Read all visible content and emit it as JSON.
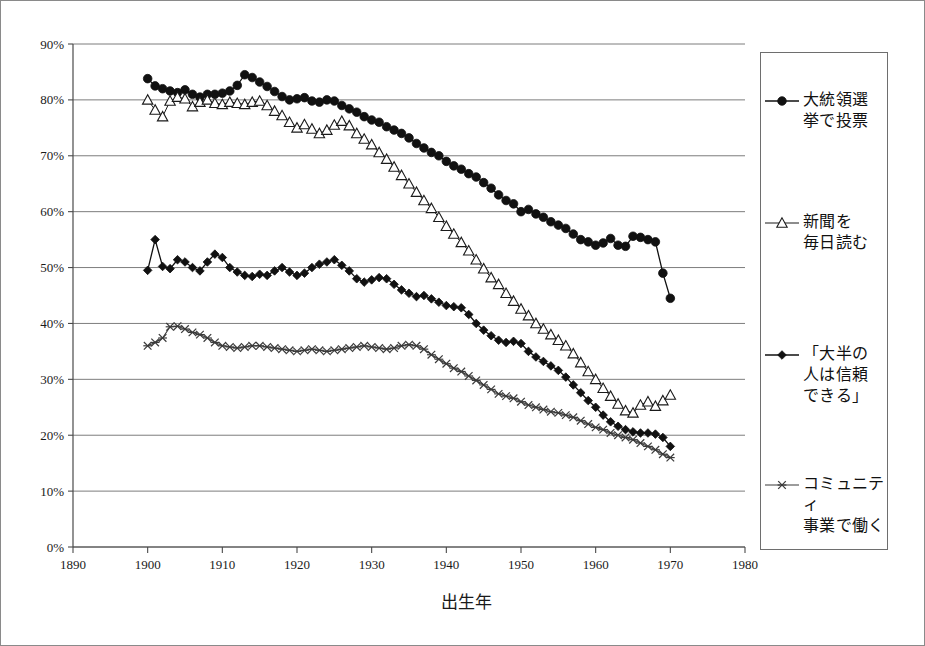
{
  "chart_data": {
    "type": "line",
    "title": "",
    "xlabel": "出生年",
    "ylabel": "",
    "xlim": [
      1890,
      1980
    ],
    "ylim": [
      0,
      90
    ],
    "x_ticks": [
      "1890",
      "1900",
      "1910",
      "1920",
      "1930",
      "1940",
      "1950",
      "1960",
      "1970",
      "1980"
    ],
    "y_ticks": [
      "0%",
      "10%",
      "20%",
      "30%",
      "40%",
      "50%",
      "60%",
      "70%",
      "80%",
      "90%"
    ],
    "grid": true,
    "legend_position": "right",
    "x": [
      1900,
      1901,
      1902,
      1903,
      1904,
      1905,
      1906,
      1907,
      1908,
      1909,
      1910,
      1911,
      1912,
      1913,
      1914,
      1915,
      1916,
      1917,
      1918,
      1919,
      1920,
      1921,
      1922,
      1923,
      1924,
      1925,
      1926,
      1927,
      1928,
      1929,
      1930,
      1931,
      1932,
      1933,
      1934,
      1935,
      1936,
      1937,
      1938,
      1939,
      1940,
      1941,
      1942,
      1943,
      1944,
      1945,
      1946,
      1947,
      1948,
      1949,
      1950,
      1951,
      1952,
      1953,
      1954,
      1955,
      1956,
      1957,
      1958,
      1959,
      1960,
      1961,
      1962,
      1963,
      1964,
      1965,
      1966,
      1967,
      1968,
      1969,
      1970
    ],
    "series": [
      {
        "name": "大統領選挙で投票",
        "marker": "filled-circle",
        "values": [
          83.8,
          82.5,
          82.0,
          81.6,
          81.3,
          81.8,
          81.0,
          80.5,
          81.0,
          81.0,
          81.2,
          81.6,
          82.6,
          84.5,
          84.0,
          83.2,
          82.4,
          81.5,
          80.6,
          80.0,
          80.2,
          80.4,
          79.8,
          79.6,
          80.0,
          79.8,
          79.0,
          78.4,
          77.8,
          77.0,
          76.4,
          76.0,
          75.2,
          74.6,
          74.0,
          73.2,
          72.2,
          71.4,
          70.6,
          70.0,
          69.0,
          68.2,
          67.6,
          66.8,
          66.2,
          65.2,
          64.2,
          63.0,
          62.0,
          61.4,
          60.0,
          60.4,
          59.6,
          59.0,
          58.2,
          57.6,
          57.0,
          56.0,
          55.0,
          54.6,
          54.0,
          54.4,
          55.2,
          54.0,
          53.8,
          55.6,
          55.4,
          55.0,
          54.6,
          49.0,
          44.5
        ]
      },
      {
        "name": "新聞を毎日読む",
        "marker": "open-triangle",
        "values": [
          80.0,
          78.2,
          77.0,
          79.8,
          80.5,
          80.2,
          78.8,
          79.6,
          80.0,
          79.4,
          79.2,
          79.6,
          79.4,
          79.2,
          79.6,
          79.8,
          79.0,
          78.0,
          77.2,
          76.0,
          75.0,
          75.6,
          74.8,
          74.0,
          74.6,
          75.5,
          76.2,
          75.4,
          74.0,
          73.0,
          72.0,
          70.6,
          69.4,
          68.0,
          66.5,
          65.0,
          63.5,
          62.0,
          60.6,
          59.0,
          57.4,
          56.0,
          54.5,
          53.0,
          51.4,
          49.8,
          48.2,
          47.0,
          45.4,
          44.0,
          42.6,
          41.4,
          40.0,
          39.0,
          38.0,
          37.0,
          36.0,
          34.6,
          33.0,
          31.4,
          30.0,
          28.4,
          27.0,
          25.6,
          24.4,
          24.0,
          25.4,
          26.0,
          25.2,
          26.2,
          27.2
        ]
      },
      {
        "name": "「大半の人は信頼できる」",
        "marker": "filled-diamond",
        "values": [
          49.5,
          55.0,
          50.2,
          49.8,
          51.4,
          51.0,
          50.0,
          49.4,
          51.0,
          52.4,
          51.8,
          50.0,
          49.2,
          48.6,
          48.4,
          48.8,
          48.6,
          49.4,
          50.0,
          49.2,
          48.6,
          49.0,
          50.0,
          50.6,
          51.0,
          51.4,
          50.4,
          49.4,
          48.0,
          47.4,
          47.8,
          48.2,
          48.0,
          47.0,
          46.0,
          45.4,
          44.8,
          45.0,
          44.4,
          43.8,
          43.2,
          43.0,
          42.8,
          41.6,
          40.0,
          38.8,
          37.8,
          37.0,
          36.6,
          36.8,
          36.4,
          35.0,
          34.0,
          33.2,
          32.4,
          31.6,
          30.4,
          29.0,
          27.6,
          26.2,
          25.0,
          23.6,
          22.4,
          21.6,
          21.0,
          20.6,
          20.4,
          20.4,
          20.2,
          19.6,
          18.0
        ]
      },
      {
        "name": "コミュニティ事業で働く",
        "marker": "star",
        "values": [
          36.0,
          36.6,
          37.4,
          39.4,
          39.5,
          39.0,
          38.4,
          38.0,
          37.4,
          36.6,
          36.0,
          35.8,
          35.6,
          35.8,
          36.0,
          36.0,
          35.8,
          35.6,
          35.4,
          35.2,
          35.0,
          35.2,
          35.4,
          35.2,
          35.0,
          35.2,
          35.4,
          35.6,
          35.8,
          36.0,
          35.8,
          35.6,
          35.4,
          35.6,
          36.0,
          36.2,
          36.0,
          35.4,
          34.4,
          33.6,
          32.8,
          32.0,
          31.4,
          30.6,
          29.8,
          29.0,
          28.2,
          27.4,
          27.0,
          26.6,
          26.0,
          25.4,
          25.0,
          24.6,
          24.2,
          24.0,
          23.6,
          23.2,
          22.6,
          22.0,
          21.4,
          21.0,
          20.4,
          20.0,
          19.6,
          19.2,
          18.6,
          18.0,
          17.4,
          16.6,
          16.0
        ]
      }
    ]
  },
  "legend": {
    "entries": [
      {
        "label": "大統領選\n挙で投票",
        "marker": "filled-circle"
      },
      {
        "label": "新聞を\n毎日読む",
        "marker": "open-triangle"
      },
      {
        "label": "「大半の\n人は信頼\nできる」",
        "marker": "filled-diamond"
      },
      {
        "label": "コミュニティ\n事業で働く",
        "marker": "star"
      }
    ]
  }
}
